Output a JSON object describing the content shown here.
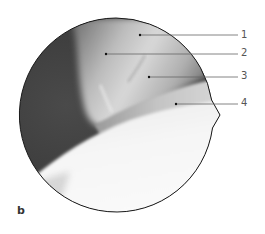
{
  "figure": {
    "panel_label": "b",
    "view": {
      "shape": "circle",
      "description": "arthroscopic view, grayscale",
      "center": [
        116,
        115
      ],
      "radius": 97,
      "notch_point": [
        220,
        115
      ]
    },
    "callouts": [
      {
        "number": "1",
        "dot": [
          140,
          35
        ],
        "label_pos": [
          241,
          30
        ]
      },
      {
        "number": "2",
        "dot": [
          106,
          54
        ],
        "label_pos": [
          241,
          48
        ]
      },
      {
        "number": "3",
        "dot": [
          149,
          77
        ],
        "label_pos": [
          241,
          71
        ]
      },
      {
        "number": "4",
        "dot": [
          176,
          104
        ],
        "label_pos": [
          241,
          98
        ]
      }
    ],
    "colors": {
      "outline": "#1a1a1a",
      "leader_line": "#666666",
      "dark_tissue": "#3c3c3c",
      "mid_tissue": "#8a8a8a",
      "bright_tissue": "#d2d2d2",
      "cartilage_surface": "#f4f4f4"
    }
  }
}
